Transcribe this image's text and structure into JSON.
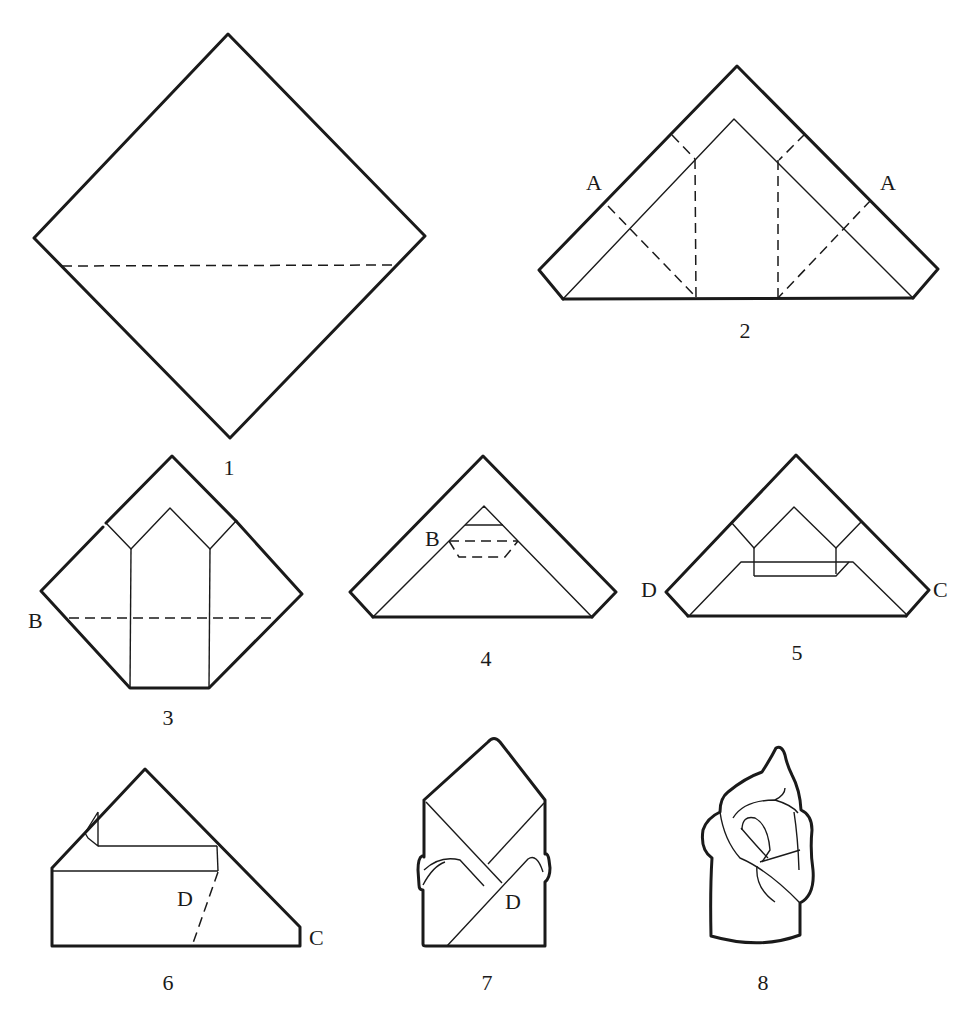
{
  "diagram": {
    "type": "napkin-folding-instructions",
    "steps": [
      {
        "number": "1",
        "labels": []
      },
      {
        "number": "2",
        "labels": [
          "A",
          "A"
        ]
      },
      {
        "number": "3",
        "labels": [
          "B"
        ]
      },
      {
        "number": "4",
        "labels": [
          "B"
        ]
      },
      {
        "number": "5",
        "labels": [
          "D",
          "C"
        ]
      },
      {
        "number": "6",
        "labels": [
          "D",
          "C"
        ]
      },
      {
        "number": "7",
        "labels": [
          "D"
        ]
      },
      {
        "number": "8",
        "labels": []
      }
    ]
  },
  "colors": {
    "line": "#1a1a1a",
    "background": "#ffffff"
  }
}
